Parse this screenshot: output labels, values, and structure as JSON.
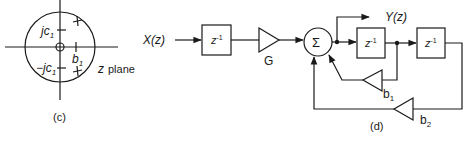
{
  "panel_c": {
    "caption": "(c)",
    "plane_label_var": "z",
    "plane_label_word": "plane",
    "zero_label_upper": "jc",
    "zero_label_upper_sub": "1",
    "zero_label_lower": "−jc",
    "zero_label_lower_sub": "1",
    "pole_real_label": "b",
    "pole_real_label_sub": "1",
    "pole_marks": [
      "+",
      "+"
    ],
    "origin_marker": "o"
  },
  "panel_d": {
    "caption": "(d)",
    "input_label": "X(z)",
    "output_label": "Y(z)",
    "delay_blocks": [
      {
        "label": "z",
        "exp": "-1"
      },
      {
        "label": "z",
        "exp": "-1"
      },
      {
        "label": "z",
        "exp": "-1"
      }
    ],
    "gain_input": "G",
    "summer_symbol": "Σ",
    "feedback_gains": [
      {
        "label": "b",
        "sub": "1"
      },
      {
        "label": "b",
        "sub": "2"
      }
    ]
  }
}
